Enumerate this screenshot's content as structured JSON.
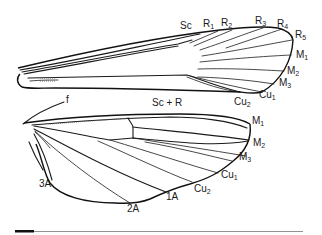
{
  "figure": {
    "type": "insect wing venation diagram",
    "forewing": {
      "labels": [
        {
          "id": "Sc",
          "text": "Sc",
          "sub": ""
        },
        {
          "id": "R1",
          "text": "R",
          "sub": "1"
        },
        {
          "id": "R2",
          "text": "R",
          "sub": "2"
        },
        {
          "id": "R3",
          "text": "R",
          "sub": "3"
        },
        {
          "id": "R4",
          "text": "R",
          "sub": "4"
        },
        {
          "id": "R5",
          "text": "R",
          "sub": "5"
        },
        {
          "id": "M1",
          "text": "M",
          "sub": "1"
        },
        {
          "id": "M2",
          "text": "M",
          "sub": "2"
        },
        {
          "id": "M3",
          "text": "M",
          "sub": "3"
        },
        {
          "id": "Cu1",
          "text": "Cu",
          "sub": "1"
        },
        {
          "id": "Cu2",
          "text": "Cu",
          "sub": "2"
        }
      ]
    },
    "hindwing": {
      "labels": [
        {
          "id": "f",
          "text": "f",
          "sub": ""
        },
        {
          "id": "ScR",
          "text": "Sc + R",
          "sub": ""
        },
        {
          "id": "M1",
          "text": "M",
          "sub": "1"
        },
        {
          "id": "M2",
          "text": "M",
          "sub": "2"
        },
        {
          "id": "M3",
          "text": "M",
          "sub": "3"
        },
        {
          "id": "Cu1",
          "text": "Cu",
          "sub": "1"
        },
        {
          "id": "Cu2",
          "text": "Cu",
          "sub": "2"
        },
        {
          "id": "1A",
          "text": "1A",
          "sub": ""
        },
        {
          "id": "2A",
          "text": "2A",
          "sub": ""
        },
        {
          "id": "3A",
          "text": "3A",
          "sub": ""
        }
      ]
    },
    "scale_bar": {
      "present": true
    }
  }
}
